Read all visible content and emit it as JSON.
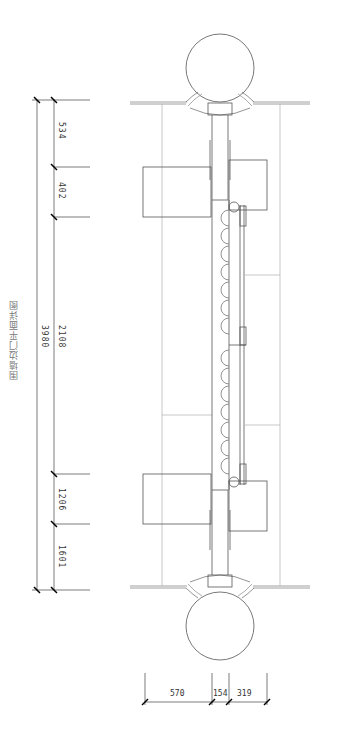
{
  "drawing": {
    "title": "围墙边门平面详图",
    "line_color": "#555555",
    "light_line_color": "#b0b0b0"
  },
  "dimensions": {
    "left_outer_total": "3980",
    "left_inner": [
      {
        "label": "534"
      },
      {
        "label": "402"
      },
      {
        "label": "2108"
      },
      {
        "label": "1206"
      },
      {
        "label": "1601"
      }
    ],
    "bottom": [
      {
        "label": "570"
      },
      {
        "label": "154"
      },
      {
        "label": "319"
      }
    ]
  }
}
